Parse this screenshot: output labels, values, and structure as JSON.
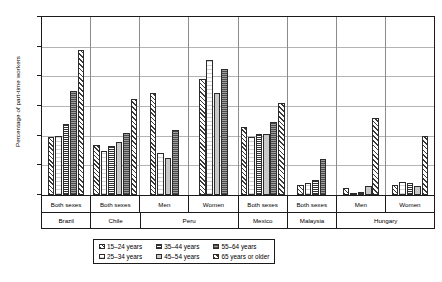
{
  "chart_data": {
    "type": "bar",
    "title": "",
    "xlabel": "",
    "ylabel": "Percentage of part-time workers",
    "ylim": [
      0,
      60
    ],
    "ytick_labels": [
      "60.0",
      "50.0",
      "40.0",
      "30.0",
      "20.0",
      "10.0",
      "0.0"
    ],
    "ytick_values": [
      60,
      50,
      40,
      30,
      20,
      10,
      0
    ],
    "grid": true,
    "legend_position": "bottom",
    "categories": [
      "Both sexes",
      "Both sexes",
      "Men",
      "Women",
      "Both sexes",
      "Both sexes",
      "Men",
      "Women"
    ],
    "countries": [
      {
        "name": "Brazil",
        "span": 1
      },
      {
        "name": "Chile",
        "span": 1
      },
      {
        "name": "Peru",
        "span": 2
      },
      {
        "name": "Mexico",
        "span": 1
      },
      {
        "name": "Malaysia",
        "span": 1
      },
      {
        "name": "Hungary",
        "span": 2
      }
    ],
    "series": [
      {
        "name": "15–24 years",
        "values": [
          19.5,
          17.0,
          34.5,
          39.0,
          23.0,
          3.5,
          2.5,
          3.5
        ]
      },
      {
        "name": "25–34 years",
        "values": [
          20.0,
          15.0,
          14.0,
          45.5,
          19.5,
          4.0,
          0.7,
          4.5
        ]
      },
      {
        "name": "35–44 years",
        "values": [
          24.0,
          16.5,
          0.0,
          0.0,
          20.5,
          5.0,
          1.0,
          4.0
        ]
      },
      {
        "name": "45–54 years",
        "values": [
          0.0,
          18.0,
          12.5,
          34.5,
          20.5,
          0.0,
          3.0,
          3.0
        ]
      },
      {
        "name": "55–64 years",
        "values": [
          35.0,
          21.0,
          22.0,
          42.5,
          24.5,
          12.0,
          0.0,
          0.0
        ]
      },
      {
        "name": "65 years or older",
        "values": [
          49.0,
          32.5,
          0.0,
          0.0,
          31.0,
          0.0,
          26.0,
          20.0
        ]
      }
    ]
  },
  "legend": {
    "items": [
      {
        "label": "15–24 years"
      },
      {
        "label": "35–44 years"
      },
      {
        "label": "55–64 years"
      },
      {
        "label": "25–34 years"
      },
      {
        "label": "45–54 years"
      },
      {
        "label": "65 years or older"
      }
    ]
  }
}
